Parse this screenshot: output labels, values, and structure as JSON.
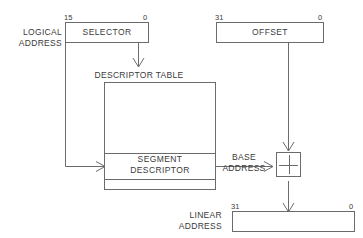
{
  "diagram": {
    "stroke_color": "#6b6b6b",
    "text_color": "#3a3a3a",
    "background": "#ffffff"
  },
  "selector": {
    "label": "SELECTOR",
    "bit_high": "15",
    "bit_low": "0"
  },
  "offset": {
    "label": "OFFSET",
    "bit_high": "31",
    "bit_low": "0"
  },
  "logical_address": {
    "label": "LOGICAL\nADDRESS"
  },
  "descriptor_table": {
    "label": "DESCRIPTOR TABLE"
  },
  "segment_descriptor": {
    "label": "SEGMENT\nDESCRIPTOR"
  },
  "base_address": {
    "label": "BASE\nADDRESS"
  },
  "adder": {
    "symbol": "+"
  },
  "linear_address": {
    "label": "LINEAR\nADDRESS",
    "bit_high": "31",
    "bit_low": "0"
  }
}
